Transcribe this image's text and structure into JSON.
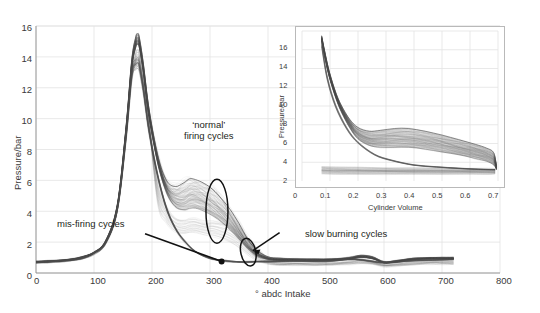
{
  "figure": {
    "background_color": "#ffffff",
    "trace_color": "#4a4a4a",
    "grid_color": "#e3e3e3",
    "annotation_color": "#111111"
  },
  "main_chart": {
    "ylabel": "Pressure/bar",
    "xlabel": "° abdc Intake",
    "xticks": [
      "0",
      "100",
      "200",
      "300",
      "400",
      "500",
      "600",
      "700",
      "800"
    ],
    "yticks": [
      "0",
      "2",
      "4",
      "6",
      "8",
      "10",
      "12",
      "14",
      "16"
    ],
    "annotations": {
      "normal": "‘normal’\nfiring cycles",
      "normal_line1": "‘normal’",
      "normal_line2": "firing cycles",
      "misfiring": "mis-firing cycles",
      "slow_burning": "slow burning cycles"
    }
  },
  "inset_chart": {
    "ylabel": "Pressure/bar",
    "xlabel": "Cylinder Volume",
    "xticks": [
      "0",
      "0.1",
      "0.2",
      "0.3",
      "0.4",
      "0.5",
      "0.6",
      "0.7"
    ],
    "yticks": [
      "2",
      "4",
      "6",
      "8",
      "10",
      "12",
      "14",
      "16"
    ]
  },
  "chart_data": [
    {
      "type": "line",
      "id": "main",
      "title": "",
      "xlabel": "° abdc Intake",
      "ylabel": "Pressure/bar",
      "xlim": [
        0,
        800
      ],
      "ylim": [
        0,
        16
      ],
      "xticks": [
        0,
        100,
        200,
        300,
        400,
        500,
        600,
        700,
        800
      ],
      "yticks": [
        0,
        2,
        4,
        6,
        8,
        10,
        12,
        14,
        16
      ],
      "grid": true,
      "legend": "none",
      "description": "Dense overlay of many consecutive engine cycles: in-cylinder pressure versus crank angle. A sharp motored/compression peak near 175 deg abdc reaching about 15.5 bar, followed by a broad expansion/combustion hump between roughly 220 and 380 deg, then a low flat exhaust/intake tail near 0.7-1.2 bar out to 720 deg.",
      "series": [
        {
          "name": "normal firing cycles (upper envelope)",
          "x": [
            0,
            20,
            40,
            60,
            80,
            100,
            120,
            140,
            155,
            165,
            172,
            175,
            178,
            185,
            195,
            210,
            225,
            240,
            255,
            265,
            275,
            290,
            305,
            320,
            335,
            350,
            365,
            380,
            400,
            420,
            450,
            480,
            510,
            540,
            560,
            580,
            600,
            620,
            650,
            680,
            700,
            720
          ],
          "y": [
            0.75,
            0.78,
            0.82,
            0.9,
            1.05,
            1.35,
            2.1,
            4.4,
            9.4,
            13.8,
            15.3,
            15.5,
            15.3,
            13.6,
            10.6,
            7.6,
            6.0,
            5.6,
            5.85,
            6.1,
            6.05,
            5.8,
            5.4,
            4.8,
            4.1,
            3.2,
            2.2,
            1.5,
            1.05,
            0.95,
            0.92,
            0.9,
            0.92,
            1.0,
            1.15,
            1.05,
            0.72,
            0.8,
            0.95,
            1.0,
            1.0,
            1.0
          ]
        },
        {
          "name": "normal firing cycles (lower envelope)",
          "x": [
            0,
            20,
            40,
            60,
            80,
            100,
            120,
            140,
            155,
            165,
            172,
            175,
            178,
            185,
            195,
            210,
            225,
            240,
            255,
            265,
            275,
            290,
            305,
            320,
            335,
            350,
            365,
            380,
            400,
            420,
            450,
            480,
            510,
            540,
            560,
            580,
            600,
            620,
            650,
            680,
            700,
            720
          ],
          "y": [
            0.72,
            0.74,
            0.78,
            0.86,
            1.0,
            1.3,
            2.0,
            4.2,
            9.0,
            13.2,
            14.6,
            14.8,
            14.6,
            13.0,
            10.1,
            7.1,
            5.2,
            4.3,
            4.1,
            4.2,
            4.2,
            4.0,
            3.7,
            3.3,
            2.8,
            2.2,
            1.6,
            1.15,
            0.88,
            0.82,
            0.8,
            0.8,
            0.82,
            0.9,
            1.0,
            0.92,
            0.66,
            0.72,
            0.86,
            0.92,
            0.92,
            0.92
          ]
        },
        {
          "name": "mis-firing cycles (motored, no combustion)",
          "x": [
            0,
            20,
            40,
            60,
            80,
            100,
            120,
            140,
            155,
            165,
            172,
            175,
            178,
            185,
            195,
            210,
            225,
            240,
            255,
            275,
            300,
            320,
            340,
            360,
            380,
            400,
            450,
            500,
            550,
            600,
            650,
            700,
            720
          ],
          "y": [
            0.7,
            0.72,
            0.76,
            0.84,
            0.98,
            1.28,
            1.95,
            4.1,
            8.8,
            12.9,
            13.5,
            13.6,
            13.4,
            11.9,
            9.2,
            6.3,
            4.2,
            2.9,
            2.1,
            1.4,
            0.95,
            0.8,
            0.75,
            0.72,
            0.72,
            0.74,
            0.76,
            0.78,
            0.9,
            0.65,
            0.8,
            0.88,
            0.88
          ]
        }
      ],
      "annotations": [
        {
          "text": "‘normal’ firing cycles",
          "kind": "ellipse-label",
          "ellipse_center_x": 312,
          "ellipse_center_y": 4.0,
          "label_x": 250,
          "label_y": 9.2
        },
        {
          "text": "mis-firing cycles",
          "kind": "arrow-label",
          "arrow_tip_x": 320,
          "arrow_tip_y": 0.72,
          "label_x": 105,
          "label_y": 2.9
        },
        {
          "text": "slow burning cycles",
          "kind": "ellipse-label",
          "ellipse_center_x": 366,
          "ellipse_center_y": 1.3,
          "label_x": 430,
          "label_y": 2.6
        }
      ]
    },
    {
      "type": "line",
      "id": "inset",
      "title": "",
      "xlabel": "Cylinder Volume",
      "ylabel": "Pressure/bar",
      "xlim": [
        0,
        0.7
      ],
      "ylim": [
        0,
        16
      ],
      "xticks": [
        0,
        0.1,
        0.2,
        0.3,
        0.4,
        0.5,
        0.6,
        0.7
      ],
      "yticks": [
        2,
        4,
        6,
        8,
        10,
        12,
        14,
        16
      ],
      "grid": true,
      "legend": "none",
      "description": "Pressure-volume (indicator) diagram for the same cycles. Expansion strokes start near 15.5 bar at minimum volume 0.07 and fall steeply, a broad bundle of firing traces bulges to about 5.5-6 bar near volume 0.33-0.40, and a thin low-pressure pumping loop runs along 0.9-1.3 bar.",
      "series": [
        {
          "name": "expansion upper envelope",
          "x": [
            0.07,
            0.08,
            0.09,
            0.1,
            0.12,
            0.14,
            0.17,
            0.2,
            0.24,
            0.28,
            0.33,
            0.38,
            0.44,
            0.5,
            0.56,
            0.62,
            0.66,
            0.685,
            0.695
          ],
          "y": [
            15.5,
            14.0,
            12.6,
            11.4,
            9.5,
            8.1,
            6.6,
            5.7,
            5.3,
            5.4,
            5.6,
            5.6,
            5.3,
            4.9,
            4.4,
            3.9,
            3.5,
            3.0,
            1.5
          ]
        },
        {
          "name": "expansion lower envelope",
          "x": [
            0.07,
            0.08,
            0.09,
            0.1,
            0.12,
            0.14,
            0.17,
            0.2,
            0.24,
            0.28,
            0.33,
            0.38,
            0.44,
            0.5,
            0.56,
            0.62,
            0.66,
            0.685,
            0.695
          ],
          "y": [
            15.0,
            13.4,
            12.0,
            10.8,
            8.9,
            7.4,
            5.7,
            4.5,
            3.8,
            3.6,
            3.6,
            3.6,
            3.4,
            3.1,
            2.8,
            2.4,
            2.1,
            1.7,
            1.2
          ]
        },
        {
          "name": "motored / mis-fire trace",
          "x": [
            0.07,
            0.09,
            0.12,
            0.16,
            0.2,
            0.26,
            0.32,
            0.4,
            0.48,
            0.56,
            0.63,
            0.69
          ],
          "y": [
            14.6,
            11.0,
            8.0,
            5.6,
            4.1,
            2.8,
            2.2,
            1.7,
            1.5,
            1.35,
            1.25,
            1.2
          ]
        },
        {
          "name": "pumping loop",
          "x": [
            0.07,
            0.12,
            0.2,
            0.3,
            0.4,
            0.5,
            0.6,
            0.68,
            0.68,
            0.6,
            0.5,
            0.4,
            0.3,
            0.2,
            0.12,
            0.07
          ],
          "y": [
            1.35,
            1.3,
            1.26,
            1.22,
            1.2,
            1.18,
            1.15,
            1.12,
            0.95,
            0.95,
            0.95,
            0.95,
            0.95,
            0.95,
            0.95,
            1.0
          ]
        }
      ]
    }
  ]
}
